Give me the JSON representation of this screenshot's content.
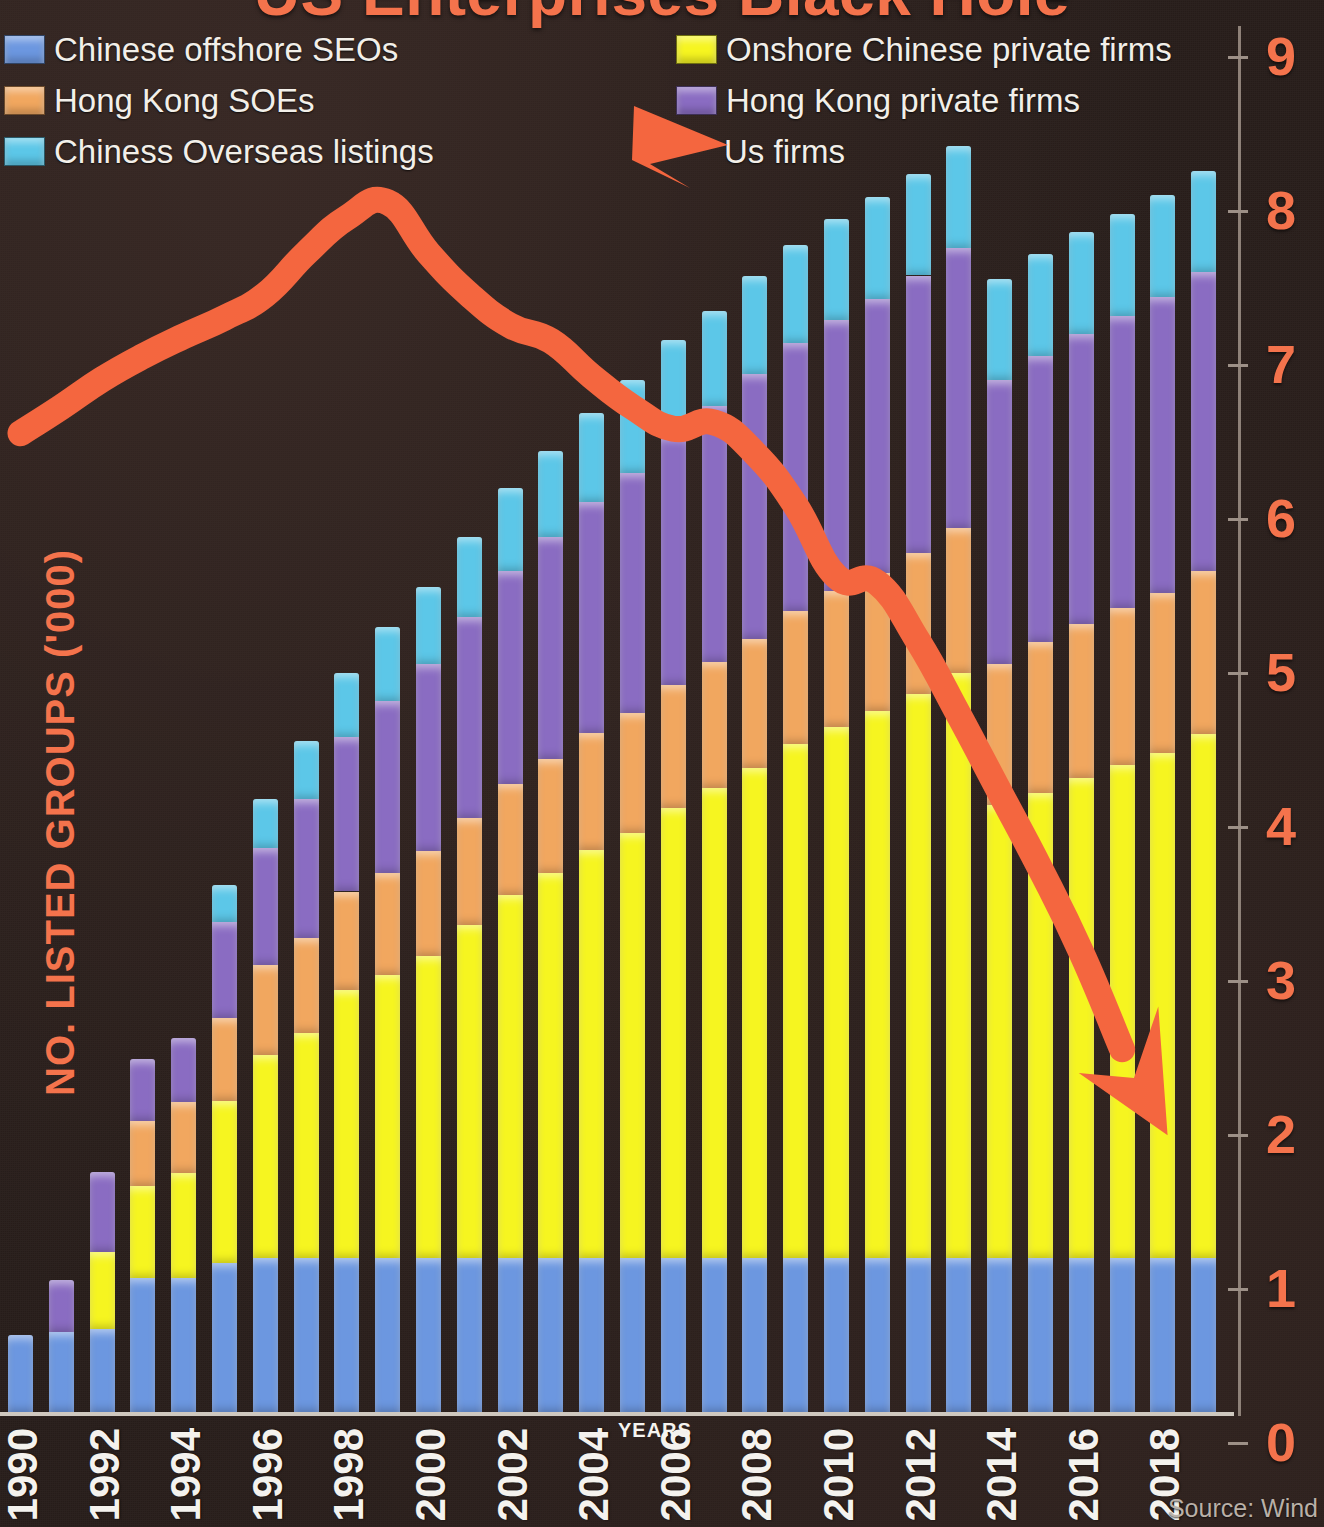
{
  "title": "US Enterprises Black Hole",
  "source": "Source: Wind",
  "axes": {
    "y_title": "NO. LISTED GROUPS ('000)",
    "x_title": "YEARS",
    "y_ticks": [
      "0",
      "1",
      "2",
      "3",
      "4",
      "5",
      "6",
      "7",
      "8",
      "9"
    ],
    "x_ticks": [
      "1990",
      "1992",
      "1994",
      "1996",
      "1998",
      "2000",
      "2002",
      "2004",
      "2006",
      "2008",
      "2010",
      "2012",
      "2014",
      "2016",
      "2018"
    ]
  },
  "legend": {
    "items": [
      {
        "label": "Chinese offshore SEOs",
        "color": "#6c97e0",
        "key": "swatch"
      },
      {
        "label": "Onshore Chinese private firms",
        "color": "#f6f520",
        "key": "swatch"
      },
      {
        "label": "Hong Kong SOEs",
        "color": "#f1a75f",
        "key": "swatch"
      },
      {
        "label": "Hong Kong private firms",
        "color": "#8a6cc2",
        "key": "swatch"
      },
      {
        "label": "Chiness Overseas listings",
        "color": "#5cc7e8",
        "key": "swatch"
      },
      {
        "label": "Us firms",
        "color": "#f4663f",
        "key": "arrow"
      }
    ]
  },
  "colors": {
    "background": "#281e1b",
    "accent": "#f4734c",
    "line": "#f4663f",
    "baseline": "#cfc8bf",
    "axis": "#8e8178",
    "legend_text": "#f2efe9",
    "xlabel_text": "#f4f2ee"
  },
  "chart_data": {
    "type": "bar",
    "title": "US Enterprises Black Hole",
    "xlabel": "YEARS",
    "ylabel": "NO. LISTED GROUPS ('000)",
    "ylim": [
      0,
      9
    ],
    "grid": false,
    "legend_position": "top",
    "stacked": true,
    "categories": [
      "1990",
      "1991",
      "1992",
      "1993",
      "1994",
      "1995",
      "1996",
      "1997",
      "1998",
      "1999",
      "2000",
      "2001",
      "2002",
      "2003",
      "2004",
      "2005",
      "2006",
      "2007",
      "2008",
      "2009",
      "2010",
      "2011",
      "2012",
      "2013",
      "2014",
      "2015",
      "2016",
      "2017",
      "2018",
      "2019"
    ],
    "series": [
      {
        "name": "Chinese offshore SEOs",
        "color": "#6c97e0",
        "values": [
          0.5,
          0.52,
          0.54,
          0.87,
          0.87,
          0.97,
          1.0,
          1.0,
          1.0,
          1.0,
          1.0,
          1.0,
          1.0,
          1.0,
          1.0,
          1.0,
          1.0,
          1.0,
          1.0,
          1.0,
          1.0,
          1.0,
          1.0,
          1.0,
          1.0,
          1.0,
          1.0,
          1.0,
          1.0,
          1.0
        ]
      },
      {
        "name": "Onshore Chinese private firms",
        "color": "#f6f520",
        "values": [
          0.0,
          0.0,
          0.5,
          0.6,
          0.68,
          1.05,
          1.32,
          1.46,
          1.74,
          1.84,
          1.96,
          2.16,
          2.36,
          2.5,
          2.65,
          2.76,
          2.92,
          3.05,
          3.18,
          3.34,
          3.45,
          3.55,
          3.66,
          3.8,
          2.94,
          3.02,
          3.12,
          3.2,
          3.28,
          3.4
        ]
      },
      {
        "name": "Hong Kong SOEs",
        "color": "#f1a75f",
        "values": [
          0.0,
          0.0,
          0.0,
          0.42,
          0.46,
          0.54,
          0.58,
          0.62,
          0.64,
          0.66,
          0.68,
          0.7,
          0.72,
          0.74,
          0.76,
          0.78,
          0.8,
          0.82,
          0.84,
          0.86,
          0.88,
          0.9,
          0.92,
          0.94,
          0.92,
          0.98,
          1.0,
          1.02,
          1.04,
          1.06
        ]
      },
      {
        "name": "Hong Kong private firms",
        "color": "#8a6cc2",
        "values": [
          0.0,
          0.34,
          0.52,
          0.4,
          0.42,
          0.62,
          0.76,
          0.9,
          1.0,
          1.12,
          1.22,
          1.3,
          1.38,
          1.44,
          1.5,
          1.56,
          1.62,
          1.66,
          1.72,
          1.74,
          1.76,
          1.78,
          1.8,
          1.82,
          1.84,
          1.86,
          1.88,
          1.9,
          1.92,
          1.94
        ]
      },
      {
        "name": "Chiness Overseas listings",
        "color": "#5cc7e8",
        "values": [
          0.0,
          0.0,
          0.0,
          0.0,
          0.0,
          0.24,
          0.32,
          0.38,
          0.42,
          0.48,
          0.5,
          0.52,
          0.54,
          0.56,
          0.58,
          0.6,
          0.62,
          0.62,
          0.64,
          0.64,
          0.66,
          0.66,
          0.66,
          0.66,
          0.66,
          0.66,
          0.66,
          0.66,
          0.66,
          0.66
        ]
      }
    ],
    "line_series": {
      "name": "Us firms",
      "color": "#f4663f",
      "type": "line",
      "x": [
        "1990",
        "1991",
        "1992",
        "1993",
        "1994",
        "1995",
        "1996",
        "1997",
        "1998",
        "1999",
        "2000",
        "2001",
        "2002",
        "2003",
        "2004",
        "2005",
        "2006",
        "2007",
        "2008",
        "2009",
        "2010",
        "2011",
        "2012",
        "2013",
        "2014",
        "2015",
        "2016",
        "2017",
        "2018"
      ],
      "values": [
        6.55,
        6.72,
        6.9,
        7.05,
        7.18,
        7.3,
        7.45,
        7.72,
        7.95,
        8.05,
        7.72,
        7.45,
        7.25,
        7.15,
        6.92,
        6.72,
        6.58,
        6.62,
        6.42,
        6.08,
        5.62,
        5.58,
        5.2,
        4.72,
        4.22,
        3.72,
        3.18,
        2.55,
        2.05
      ]
    }
  }
}
